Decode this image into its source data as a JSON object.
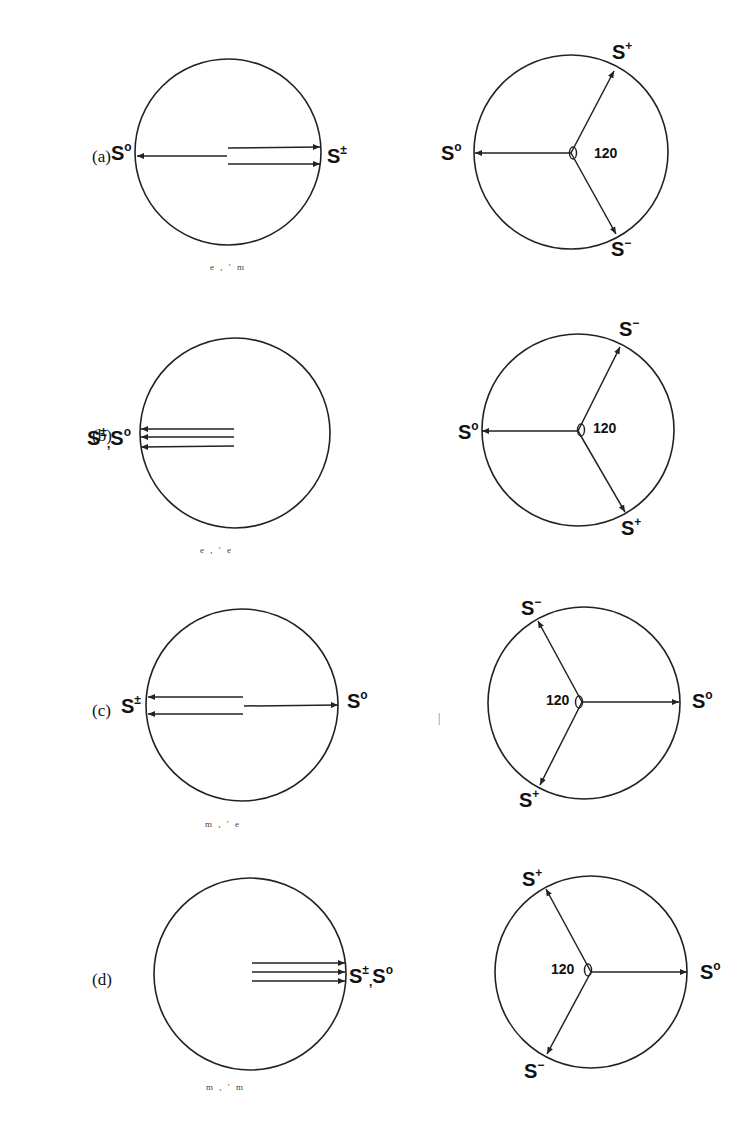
{
  "figure": {
    "panels": [
      {
        "id": "a",
        "label": "(a)",
        "left": {
          "caption": "e , ′ m",
          "labels": [
            {
              "text": "S",
              "sup": "o",
              "side": "left"
            },
            {
              "text": "S",
              "sup": "±",
              "side": "right"
            }
          ]
        },
        "right": {
          "angle": "120",
          "labels": [
            {
              "text": "S",
              "sup": "o"
            },
            {
              "text": "S",
              "sup": "+"
            },
            {
              "text": "S",
              "sup": "−"
            }
          ]
        }
      },
      {
        "id": "b",
        "label": "(b)",
        "left": {
          "caption": "e , ′ e",
          "labels": [
            {
              "text": "S",
              "sup": "±",
              "joiner": ",",
              "text2": "S",
              "sup2": "o",
              "side": "left"
            }
          ]
        },
        "right": {
          "angle": "120",
          "labels": [
            {
              "text": "S",
              "sup": "o"
            },
            {
              "text": "S",
              "sup": "−"
            },
            {
              "text": "S",
              "sup": "+"
            }
          ]
        }
      },
      {
        "id": "c",
        "label": "(c)",
        "left": {
          "caption": "m , ′ e",
          "labels": [
            {
              "text": "S",
              "sup": "±",
              "side": "left"
            },
            {
              "text": "S",
              "sup": "o",
              "side": "right"
            }
          ]
        },
        "right": {
          "angle": "120",
          "labels": [
            {
              "text": "S",
              "sup": "o"
            },
            {
              "text": "S",
              "sup": "−"
            },
            {
              "text": "S",
              "sup": "+"
            }
          ]
        }
      },
      {
        "id": "d",
        "label": "(d)",
        "left": {
          "caption": "m , ′ m",
          "labels": [
            {
              "text": "S",
              "sup": "±",
              "joiner": ",",
              "text2": "S",
              "sup2": "o",
              "side": "right"
            }
          ]
        },
        "right": {
          "angle": "120",
          "labels": [
            {
              "text": "S",
              "sup": "o"
            },
            {
              "text": "S",
              "sup": "+"
            },
            {
              "text": "S",
              "sup": "−"
            }
          ]
        }
      }
    ],
    "stray_mark": "|"
  }
}
